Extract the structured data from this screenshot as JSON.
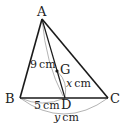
{
  "diagram": {
    "type": "triangle-geometry",
    "points": {
      "A": {
        "label": "A",
        "x": 42,
        "y": 19
      },
      "B": {
        "label": "B",
        "x": 20,
        "y": 98
      },
      "C": {
        "label": "C",
        "x": 108,
        "y": 98
      },
      "D": {
        "label": "D",
        "x": 65,
        "y": 98
      },
      "G": {
        "label": "G",
        "x": 57,
        "y": 71
      }
    },
    "dimensions": {
      "AD": {
        "value": "9",
        "unit": "cm"
      },
      "GD": {
        "var": "x",
        "unit": "cm"
      },
      "BD": {
        "value": "5",
        "unit": "cm"
      },
      "BC": {
        "var": "y",
        "unit": "cm"
      }
    },
    "colors": {
      "line": "#1a1a1a",
      "dimension_arc": "#aaaaaa"
    }
  }
}
